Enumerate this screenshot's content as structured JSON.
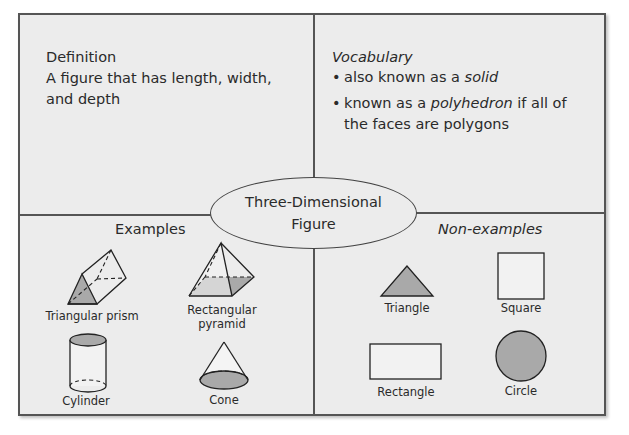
{
  "center": {
    "line1": "Three-Dimensional",
    "line2": "Figure"
  },
  "definition": {
    "title": "Definition",
    "body": "A figure that has length, width, and depth"
  },
  "vocabulary": {
    "title": "Vocabulary",
    "items": [
      {
        "prefix": "also known as a ",
        "emphasis": "solid",
        "suffix": ""
      },
      {
        "prefix": "known as a ",
        "emphasis": "polyhedron",
        "suffix": " if all of the faces are polygons"
      }
    ]
  },
  "examples": {
    "title": "Examples",
    "items": [
      {
        "label": "Triangular prism",
        "icon": "triangular-prism-icon"
      },
      {
        "label": "Rectangular pyramid",
        "label_line1": "Rectangular",
        "label_line2": "pyramid",
        "icon": "rectangular-pyramid-icon"
      },
      {
        "label": "Cylinder",
        "icon": "cylinder-icon"
      },
      {
        "label": "Cone",
        "icon": "cone-icon"
      }
    ]
  },
  "non_examples": {
    "title": "Non-examples",
    "items": [
      {
        "label": "Triangle",
        "icon": "triangle-icon"
      },
      {
        "label": "Square",
        "icon": "square-icon"
      },
      {
        "label": "Rectangle",
        "icon": "rectangle-icon"
      },
      {
        "label": "Circle",
        "icon": "circle-icon"
      }
    ]
  },
  "colors": {
    "background": "#ececec",
    "border": "#555555",
    "shape_fill": "#a9a9a9",
    "text": "#2a2a2a"
  }
}
